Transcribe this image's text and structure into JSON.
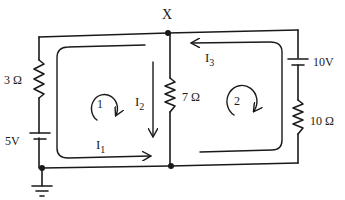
{
  "diagram": {
    "type": "circuit",
    "node_label": "X",
    "components": {
      "r_left": "3 Ω",
      "r_middle": "7 Ω",
      "r_right": "10 Ω",
      "v_left": "5V",
      "v_right": "10V"
    },
    "currents": {
      "i1": "I",
      "i1_sub": "1",
      "i2": "I",
      "i2_sub": "2",
      "i3": "I",
      "i3_sub": "3"
    },
    "loops": {
      "loop1": "1",
      "loop2": "2"
    },
    "colors": {
      "ink": "#1a1a1a",
      "background": "#ffffff"
    }
  }
}
